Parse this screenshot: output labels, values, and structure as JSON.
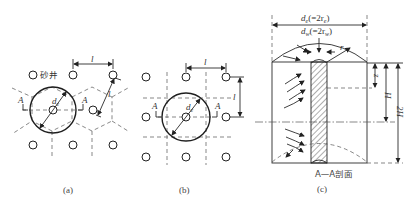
{
  "figure": {
    "panels": [
      {
        "id": "a",
        "caption": "(a)",
        "layout": "triangular",
        "labels": {
          "sand_well": "砂井",
          "spacing": "l",
          "diameter": "de",
          "section_left": "A",
          "section_right": "A"
        }
      },
      {
        "id": "b",
        "caption": "(b)",
        "layout": "square",
        "labels": {
          "spacing_h": "l",
          "spacing_v": "l",
          "diameter": "de",
          "section_left": "A",
          "section_right": "A"
        }
      },
      {
        "id": "c",
        "caption": "(c)",
        "section_title": "A—A剖面",
        "labels": {
          "de": "de(=2re)",
          "dw": "dw(=2rw)",
          "r": "r",
          "z": "z",
          "H": "H",
          "twoH": "2H"
        }
      }
    ]
  }
}
